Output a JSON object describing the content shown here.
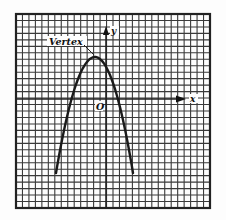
{
  "diagram": {
    "type": "coordinate-graph",
    "labels": {
      "vertex": "Vertex",
      "y_axis": "y",
      "x_axis": "x",
      "origin": "O"
    },
    "colors": {
      "grid": "#3a3a3a",
      "curve": "#1a1a1a",
      "background": "#fdfdfd"
    },
    "grid": {
      "left": 16,
      "top": 14,
      "right": 210,
      "bottom": 208,
      "cells": 30
    },
    "axes": {
      "origin_px": [
        106,
        99
      ],
      "x_arrow_px": 182,
      "y_arrow_px": 30
    },
    "curve": {
      "shape": "parabola",
      "opens": "down",
      "vertex_px": [
        95,
        57
      ],
      "left_end_px": [
        56,
        173
      ],
      "right_end_px": [
        133,
        173
      ]
    }
  }
}
